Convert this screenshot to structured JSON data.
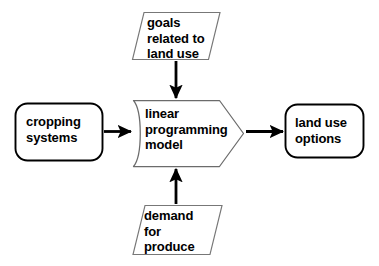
{
  "diagram": {
    "background_color": "#ffffff",
    "stroke_color": "#000000",
    "parallelogram_stroke_color": "#555555",
    "text_color": "#000000",
    "nodes": [
      {
        "id": "cropping-systems",
        "label": "cropping\nsystems",
        "shape": "rounded-rectangle",
        "role": "input"
      },
      {
        "id": "linear-programming-model",
        "label": "linear\nprogramming\nmodel",
        "shape": "chevron-pentagon",
        "role": "process"
      },
      {
        "id": "land-use-options",
        "label": "land use\noptions",
        "shape": "rounded-rectangle",
        "role": "output"
      },
      {
        "id": "goals-related-to-land-use",
        "label": "goals\nrelated to\nland use",
        "shape": "parallelogram",
        "role": "input-data"
      },
      {
        "id": "demand-for-produce",
        "label": "demand\nfor\nproduce",
        "shape": "parallelogram",
        "role": "input-data"
      }
    ],
    "edges": [
      {
        "id": "cropping-to-model",
        "from": "cropping-systems",
        "to": "linear-programming-model",
        "direction": "right"
      },
      {
        "id": "model-to-options",
        "from": "linear-programming-model",
        "to": "land-use-options",
        "direction": "right"
      },
      {
        "id": "goals-to-model",
        "from": "goals-related-to-land-use",
        "to": "linear-programming-model",
        "direction": "down"
      },
      {
        "id": "demand-to-model",
        "from": "demand-for-produce",
        "to": "linear-programming-model",
        "direction": "up"
      }
    ]
  }
}
